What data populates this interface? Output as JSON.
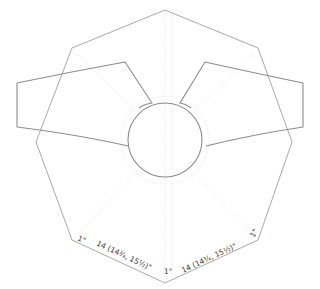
{
  "diagram": {
    "type": "knitting-schematic",
    "colors": {
      "outline": "#a9a9a9",
      "pieces": "#8c8c8c",
      "guides": "#e4e4e4",
      "text": "#3a3a3a"
    },
    "labels": {
      "left_corner": "1\"",
      "left_edge": "14 (14¾, 15½)\"",
      "bottom_corner": "1\"",
      "right_edge": "14 (14¾, 15½)\"",
      "right_corner": "1\""
    }
  }
}
